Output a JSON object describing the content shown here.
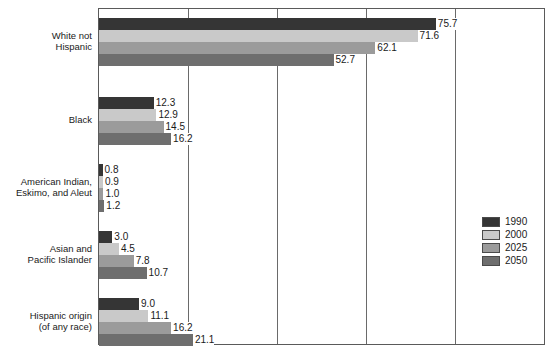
{
  "chart_data": {
    "type": "bar",
    "orientation": "horizontal",
    "title": "",
    "xlabel": "",
    "ylabel": "",
    "xlim": [
      0,
      100
    ],
    "grid": true,
    "gridlines": [
      0,
      20,
      40,
      60,
      80,
      100
    ],
    "legend_position": "right",
    "categories": [
      "White not Hispanic",
      "Black",
      "American Indian, Eskimo, and Aleut",
      "Asian and Pacific Islander",
      "Hispanic origin (of any race)"
    ],
    "series": [
      {
        "name": "1990",
        "color": "#353535",
        "values": [
          75.7,
          12.3,
          0.8,
          3.0,
          9.0
        ]
      },
      {
        "name": "2000",
        "color": "#c9c9c9",
        "values": [
          71.6,
          12.9,
          0.9,
          4.5,
          11.1
        ]
      },
      {
        "name": "2025",
        "color": "#9b9b9b",
        "values": [
          62.1,
          14.5,
          1.0,
          7.8,
          16.2
        ]
      },
      {
        "name": "2050",
        "color": "#6e6e6e",
        "values": [
          52.7,
          16.2,
          1.2,
          10.7,
          21.1
        ]
      }
    ],
    "value_labels": [
      [
        "75.7",
        "71.6",
        "62.1",
        "52.7"
      ],
      [
        "12.3",
        "12.9",
        "14.5",
        "16.2"
      ],
      [
        "0.8",
        "0.9",
        "1.0",
        "1.2"
      ],
      [
        "3.0",
        "4.5",
        "7.8",
        "10.7"
      ],
      [
        "9.0",
        "11.1",
        "16.2",
        "21.1"
      ]
    ]
  },
  "category_labels": [
    {
      "lines": [
        "White not",
        "Hispanic"
      ]
    },
    {
      "lines": [
        "Black"
      ]
    },
    {
      "lines": [
        "American Indian,",
        "Eskimo, and Aleut"
      ]
    },
    {
      "lines": [
        "Asian and",
        "Pacific Islander"
      ]
    },
    {
      "lines": [
        "Hispanic origin",
        "(of any race)"
      ]
    }
  ],
  "legend": {
    "items": [
      {
        "label": "1990",
        "color": "#353535"
      },
      {
        "label": "2000",
        "color": "#c9c9c9"
      },
      {
        "label": "2025",
        "color": "#9b9b9b"
      },
      {
        "label": "2050",
        "color": "#6e6e6e"
      }
    ]
  }
}
